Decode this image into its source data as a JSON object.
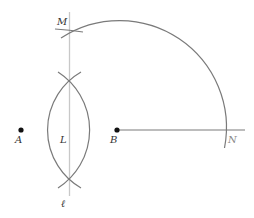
{
  "diagram": {
    "type": "geometric-construction",
    "colors": {
      "line": "#7a7a7a",
      "bisector": "#c8c8c8",
      "point": "#111111",
      "label": "#333333"
    },
    "points": [
      {
        "id": "A",
        "label": "A",
        "x": 21,
        "y": 130
      },
      {
        "id": "B",
        "label": "B",
        "x": 117,
        "y": 130
      }
    ],
    "labels": {
      "M": "M",
      "N": "N",
      "L": "L",
      "ell": "ℓ",
      "A": "A",
      "B": "B"
    }
  }
}
